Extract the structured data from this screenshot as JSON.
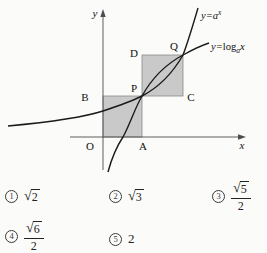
{
  "figure": {
    "y_axis_label": "y",
    "x_axis_label": "x",
    "origin": "O",
    "points": {
      "A": "A",
      "B": "B",
      "C": "C",
      "D": "D",
      "P": "P",
      "Q": "Q"
    },
    "exp_label": {
      "base": "y=a",
      "sup": "x"
    },
    "log_label": {
      "y_eq": "y=",
      "fn": "log",
      "sub": "a",
      "arg": "x"
    },
    "colors": {
      "square_fill": "#c9c9c9",
      "square_stroke": "#8a8a8a",
      "curve": "#1b1b1b",
      "axis": "#4d4d4d"
    }
  },
  "choices": [
    {
      "digit": "1",
      "sqrt": "2"
    },
    {
      "digit": "2",
      "sqrt": "3"
    },
    {
      "digit": "3",
      "frac_sqrt_num": "5",
      "frac_den": "2"
    },
    {
      "digit": "4",
      "frac_sqrt_num": "6",
      "frac_den": "2"
    },
    {
      "digit": "5",
      "value": "2"
    }
  ]
}
